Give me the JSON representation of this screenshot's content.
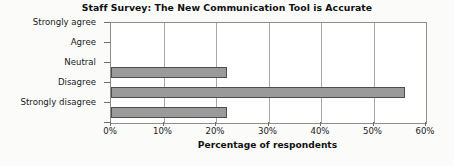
{
  "chart_data": {
    "type": "bar",
    "orientation": "horizontal",
    "title": "Staff Survey:  The New Communication Tool is Accurate",
    "xlabel": "Percentage of respondents",
    "ylabel": "",
    "categories": [
      "Strongly agree",
      "Agree",
      "Neutral",
      "Disagree",
      "Strongly disagree"
    ],
    "values": [
      0,
      0,
      22,
      56,
      22
    ],
    "xlim": [
      0,
      60
    ],
    "xticks": [
      0,
      10,
      20,
      30,
      40,
      50,
      60
    ],
    "xtick_labels": [
      "0%",
      "10%",
      "20%",
      "30%",
      "40%",
      "50%",
      "60%"
    ],
    "grid": "vertical",
    "legend": "none",
    "bar_color": "#9a9a9a",
    "bar_border_color": "#4e4e4e",
    "plot_background": "#ffffff",
    "axis_color": "#8d8d8d",
    "gridline_color": "#a8a8a8"
  }
}
